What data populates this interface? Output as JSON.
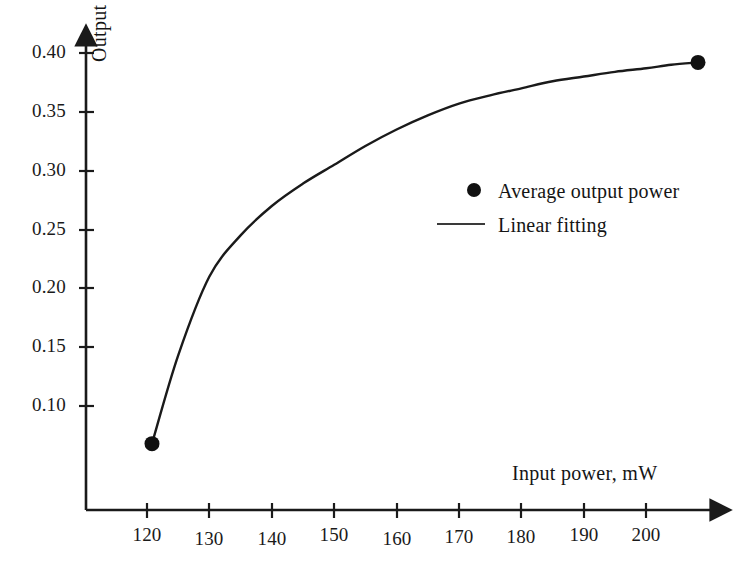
{
  "chart_data": {
    "type": "line",
    "title": "",
    "subtitle": "",
    "xlabel": "Input power, mW",
    "ylabel": "Output power, mW",
    "xlim": [
      113,
      213
    ],
    "ylim": [
      0.045,
      0.415
    ],
    "xticks": [
      120,
      130,
      140,
      150,
      160,
      170,
      180,
      190,
      200
    ],
    "xtick_labels": [
      "120",
      "130",
      "140",
      "150",
      "160",
      "170",
      "180",
      "190",
      "200"
    ],
    "yticks": [
      0.1,
      0.15,
      0.2,
      0.25,
      0.3,
      0.35,
      0.4
    ],
    "ytick_labels": [
      "0.10",
      "0.15",
      "0.20",
      "0.25",
      "0.30",
      "0.35",
      "0.40"
    ],
    "grid": false,
    "legend_position": "center-right",
    "axis_style": "arrow-ended-lines",
    "line_color": "#1a1a1a",
    "marker_color": "#111111",
    "series": [
      {
        "name": "Average output power",
        "marker": "circle",
        "type": "scatter",
        "x": [
          120.8,
          208.3
        ],
        "y": [
          0.068,
          0.392
        ]
      },
      {
        "name": "Linear fitting",
        "marker": "none",
        "type": "line",
        "x": [
          120.8,
          125,
          130,
          135,
          140,
          145,
          150,
          155,
          160,
          165,
          170,
          175,
          180,
          185,
          190,
          195,
          200,
          204,
          208.3
        ],
        "y": [
          0.068,
          0.143,
          0.21,
          0.245,
          0.27,
          0.289,
          0.305,
          0.321,
          0.335,
          0.347,
          0.357,
          0.364,
          0.37,
          0.376,
          0.38,
          0.384,
          0.387,
          0.39,
          0.392
        ]
      }
    ]
  },
  "legend": {
    "items": [
      {
        "label": "Average output power",
        "key": "dot"
      },
      {
        "label": "Linear fitting",
        "key": "line"
      }
    ]
  }
}
